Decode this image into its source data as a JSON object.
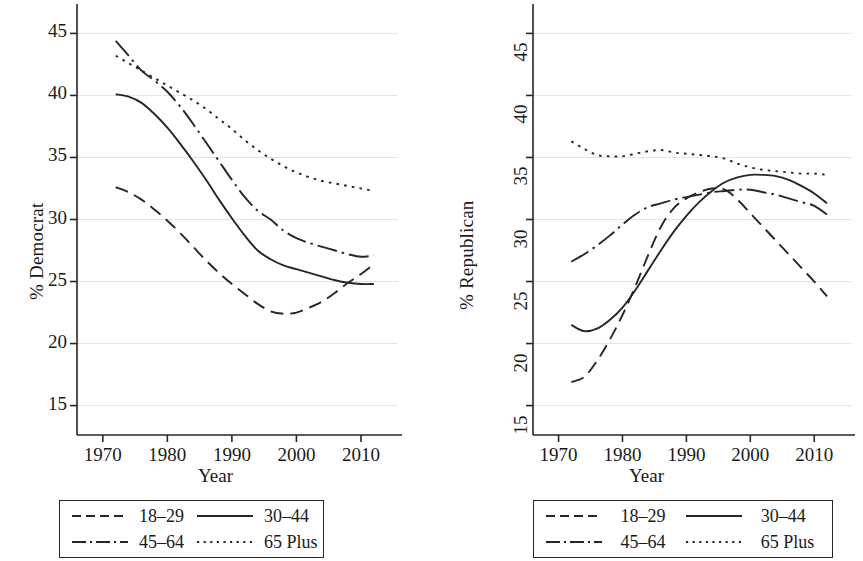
{
  "figure": {
    "background": "#ffffff",
    "line_color": "#262626",
    "grid_color": "#e3e3e3"
  },
  "panels": [
    {
      "id": "democrat",
      "ylabel": "% Democrat",
      "xlabel": "Year"
    },
    {
      "id": "republican",
      "ylabel": "% Republican",
      "xlabel": "Year"
    }
  ],
  "legend": {
    "entries": [
      {
        "label": "18–29",
        "dash": "dashed"
      },
      {
        "label": "30–44",
        "dash": "solid"
      },
      {
        "label": "45–64",
        "dash": "dashdot"
      },
      {
        "label": "65 Plus",
        "dash": "dotted"
      }
    ]
  },
  "chart_data": [
    {
      "type": "line",
      "title": "",
      "xlabel": "Year",
      "ylabel": "% Democrat",
      "xlim": [
        1966,
        1914.5
      ],
      "x_ticks": [
        1970,
        1980,
        1990,
        2000,
        2010
      ],
      "x_tick_labels": [
        "1970",
        "1980",
        "1990",
        "2000",
        "2010"
      ],
      "ylim": [
        14,
        46
      ],
      "y_ticks": [
        15,
        20,
        25,
        30,
        35,
        40,
        45
      ],
      "y_tick_labels": [
        "15",
        "20",
        "25",
        "30",
        "35",
        "40",
        "45"
      ],
      "grid": "horizontal",
      "legend_position": "below",
      "series": [
        {
          "name": "18–29",
          "dash": "dashed",
          "x": [
            1972,
            1974,
            1976,
            1978,
            1980,
            1982,
            1984,
            1986,
            1988,
            1990,
            1992,
            1994,
            1996,
            1998,
            2000,
            2002,
            2004,
            2006,
            2008,
            2010,
            2012
          ],
          "values": [
            32.6,
            32.2,
            31.6,
            30.8,
            29.9,
            28.9,
            27.8,
            26.7,
            25.7,
            24.8,
            24.0,
            23.2,
            22.6,
            22.4,
            22.5,
            22.9,
            23.4,
            24.1,
            24.9,
            25.6,
            26.4
          ]
        },
        {
          "name": "30–44",
          "dash": "solid",
          "x": [
            1972,
            1974,
            1976,
            1978,
            1980,
            1982,
            1984,
            1986,
            1988,
            1990,
            1992,
            1994,
            1996,
            1998,
            2000,
            2002,
            2004,
            2006,
            2008,
            2010,
            2012
          ],
          "values": [
            40.1,
            39.9,
            39.4,
            38.5,
            37.4,
            36.1,
            34.7,
            33.2,
            31.6,
            30.1,
            28.7,
            27.5,
            26.8,
            26.3,
            26.0,
            25.7,
            25.4,
            25.1,
            24.9,
            24.8,
            24.8
          ]
        },
        {
          "name": "45–64",
          "dash": "dashdot",
          "x": [
            1972,
            1974,
            1976,
            1978,
            1980,
            1982,
            1984,
            1986,
            1988,
            1990,
            1992,
            1994,
            1996,
            1998,
            2000,
            2002,
            2004,
            2006,
            2008,
            2010,
            2012
          ],
          "values": [
            44.4,
            43.2,
            42.0,
            41.2,
            40.3,
            39.1,
            37.7,
            36.2,
            34.7,
            33.2,
            31.8,
            30.7,
            30.0,
            29.1,
            28.5,
            28.1,
            27.8,
            27.5,
            27.2,
            27.0,
            27.1
          ]
        },
        {
          "name": "65 Plus",
          "dash": "dotted",
          "x": [
            1972,
            1974,
            1976,
            1978,
            1980,
            1982,
            1984,
            1986,
            1988,
            1990,
            1992,
            1994,
            1996,
            1998,
            2000,
            2002,
            2004,
            2006,
            2008,
            2010,
            2012
          ],
          "values": [
            43.2,
            42.6,
            42.0,
            41.4,
            40.8,
            40.2,
            39.6,
            38.9,
            38.1,
            37.3,
            36.4,
            35.6,
            34.9,
            34.3,
            33.8,
            33.4,
            33.1,
            32.9,
            32.7,
            32.5,
            32.3
          ]
        }
      ]
    },
    {
      "type": "line",
      "title": "",
      "xlabel": "Year",
      "ylabel": "% Republican",
      "xlim": [
        1966,
        2014.5
      ],
      "x_ticks": [
        1970,
        1980,
        1990,
        2000,
        2010
      ],
      "x_tick_labels": [
        "1970",
        "1980",
        "1990",
        "2000",
        "2010"
      ],
      "ylim": [
        14,
        46
      ],
      "y_ticks": [
        15,
        20,
        25,
        30,
        35,
        40,
        45
      ],
      "y_tick_labels": [
        "15",
        "20",
        "25",
        "30",
        "35",
        "40",
        "45"
      ],
      "grid": "horizontal",
      "legend_position": "below",
      "series": [
        {
          "name": "18–29",
          "dash": "dashed",
          "x": [
            1972,
            1974,
            1976,
            1978,
            1980,
            1982,
            1984,
            1986,
            1988,
            1990,
            1992,
            1994,
            1996,
            1998,
            2000,
            2002,
            2004,
            2006,
            2008,
            2010,
            2012
          ],
          "values": [
            16.9,
            17.3,
            18.6,
            20.3,
            22.3,
            24.6,
            27.1,
            29.4,
            30.9,
            31.7,
            32.2,
            32.5,
            32.4,
            31.6,
            30.5,
            29.4,
            28.3,
            27.2,
            26.1,
            25.0,
            23.8
          ]
        },
        {
          "name": "30–44",
          "dash": "solid",
          "x": [
            1972,
            1974,
            1976,
            1978,
            1980,
            1982,
            1984,
            1986,
            1988,
            1990,
            1992,
            1994,
            1996,
            1998,
            2000,
            2002,
            2004,
            2006,
            2008,
            2010,
            2012
          ],
          "values": [
            21.5,
            21.0,
            21.2,
            21.9,
            22.9,
            24.3,
            25.9,
            27.5,
            29.0,
            30.3,
            31.4,
            32.3,
            33.0,
            33.4,
            33.6,
            33.6,
            33.5,
            33.2,
            32.7,
            32.1,
            31.3
          ]
        },
        {
          "name": "45–64",
          "dash": "dashdot",
          "x": [
            1972,
            1974,
            1976,
            1978,
            1980,
            1982,
            1984,
            1986,
            1988,
            1990,
            1992,
            1994,
            1996,
            1998,
            2000,
            2002,
            2004,
            2006,
            2008,
            2010,
            2012
          ],
          "values": [
            26.6,
            27.2,
            27.9,
            28.7,
            29.6,
            30.4,
            31.0,
            31.3,
            31.6,
            31.8,
            32.0,
            32.2,
            32.3,
            32.4,
            32.4,
            32.2,
            32.0,
            31.7,
            31.4,
            31.1,
            30.4
          ]
        },
        {
          "name": "65 Plus",
          "dash": "dotted",
          "x": [
            1972,
            1974,
            1976,
            1978,
            1980,
            1982,
            1984,
            1986,
            1988,
            1990,
            1992,
            1994,
            1996,
            1998,
            2000,
            2002,
            2004,
            2006,
            2008,
            2010,
            2012
          ],
          "values": [
            36.3,
            35.7,
            35.2,
            35.1,
            35.1,
            35.3,
            35.5,
            35.6,
            35.4,
            35.3,
            35.2,
            35.1,
            34.9,
            34.5,
            34.2,
            34.0,
            33.9,
            33.8,
            33.7,
            33.7,
            33.6
          ]
        }
      ]
    }
  ]
}
